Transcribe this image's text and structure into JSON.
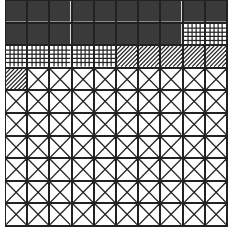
{
  "chart_data": {
    "type": "waffle",
    "title": "",
    "grid": {
      "rows": 10,
      "cols": 10,
      "fill_order": "row-major, top-left"
    },
    "categories": [
      "Solid dark",
      "Grid hatch",
      "Diagonal hatch",
      "Cross (X) hatch"
    ],
    "values": [
      18,
      7,
      6,
      69
    ],
    "total": 100,
    "series": [
      {
        "name": "Solid dark",
        "pattern": "solid",
        "color": "#3a3a3a",
        "count": 18
      },
      {
        "name": "Grid hatch",
        "pattern": "grid",
        "color": "#222222",
        "count": 7
      },
      {
        "name": "Diagonal hatch",
        "pattern": "diagonal",
        "color": "#222222",
        "count": 6
      },
      {
        "name": "Cross (X) hatch",
        "pattern": "cross",
        "color": "#222222",
        "count": 69
      }
    ],
    "legend": "none",
    "xlabel": "",
    "ylabel": ""
  }
}
